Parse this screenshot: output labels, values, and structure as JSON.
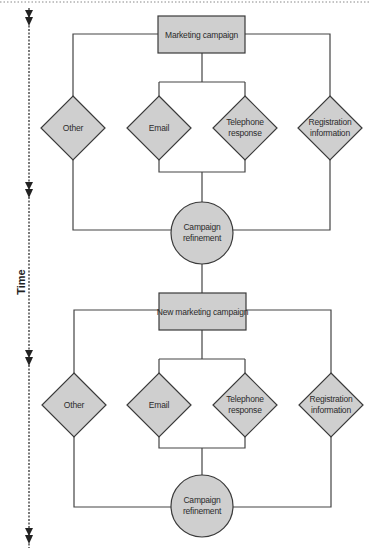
{
  "diagram": {
    "type": "flowchart",
    "time_axis": {
      "label": "Time",
      "direction": "down"
    },
    "colors": {
      "node_fill": "#cfcfcf",
      "stroke": "#3a3a3a",
      "text": "#2b2b2b"
    },
    "cycles": [
      {
        "campaign": "Marketing campaign",
        "channels": [
          {
            "label_line1": "Other",
            "label_line2": ""
          },
          {
            "label_line1": "Email",
            "label_line2": ""
          },
          {
            "label_line1": "Telephone",
            "label_line2": "response"
          },
          {
            "label_line1": "Registration",
            "label_line2": "information"
          }
        ],
        "refinement": {
          "line1": "Campaign",
          "line2": "refinement"
        }
      },
      {
        "campaign": "New marketing campaign",
        "channels": [
          {
            "label_line1": "Other",
            "label_line2": ""
          },
          {
            "label_line1": "Email",
            "label_line2": ""
          },
          {
            "label_line1": "Telephone",
            "label_line2": "response"
          },
          {
            "label_line1": "Registration",
            "label_line2": "information"
          }
        ],
        "refinement": {
          "line1": "Campaign",
          "line2": "refinement"
        }
      }
    ]
  }
}
